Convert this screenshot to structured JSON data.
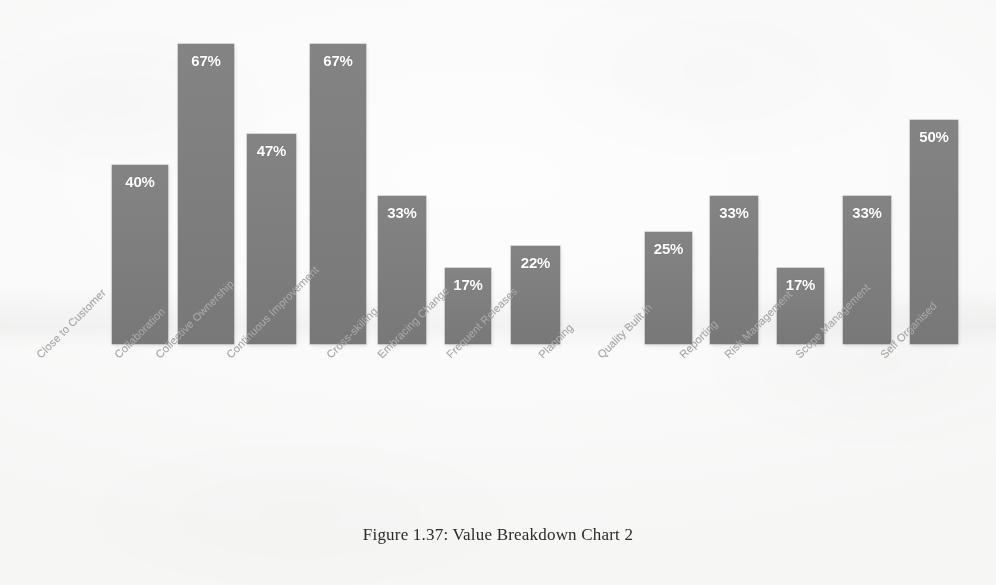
{
  "figure": {
    "caption": "Figure 1.37: Value Breakdown Chart 2"
  },
  "style": {
    "bar_color": "#7d7d7d",
    "value_label_color": "#ffffff",
    "category_label_color": "#a7a7a7",
    "background_color": "#fafafa",
    "caption_color": "#2b2b2b"
  },
  "chart_data": {
    "type": "bar",
    "title": "Figure 1.37: Value Breakdown Chart 2",
    "xlabel": "",
    "ylabel": "",
    "ylim": [
      0,
      70
    ],
    "grid": false,
    "legend": false,
    "orientation": "vertical",
    "value_label_position": "inside-top",
    "category_label_rotation": -45,
    "categories": [
      "Close to Customer",
      "Collaboration",
      "Collective Ownership",
      "Continuous Improvement",
      "Cross-skilling",
      "Embracing Change",
      "Frequent Releases",
      "Planning",
      "Quality Built in",
      "Reporting",
      "Risk Management",
      "Scope Management",
      "Self Organised"
    ],
    "values": [
      40,
      67,
      47,
      67,
      33,
      17,
      22,
      0,
      25,
      33,
      17,
      33,
      50
    ],
    "value_labels": [
      "40%",
      "67%",
      "47%",
      "67%",
      "33%",
      "17%",
      "22%",
      "",
      "25%",
      "33%",
      "17%",
      "33%",
      "50%"
    ],
    "bars": [
      {
        "category": "Close to Customer",
        "value": 40,
        "label": "40%",
        "x": 112,
        "width": 56
      },
      {
        "category": "Collaboration",
        "value": 67,
        "label": "67%",
        "x": 178,
        "width": 56
      },
      {
        "category": "Collective Ownership",
        "value": 47,
        "label": "47%",
        "x": 247,
        "width": 49
      },
      {
        "category": "Continuous Improvement",
        "value": 67,
        "label": "67%",
        "x": 310,
        "width": 56
      },
      {
        "category": "Cross-skilling",
        "value": 33,
        "label": "33%",
        "x": 378,
        "width": 48
      },
      {
        "category": "Embracing Change",
        "value": 17,
        "label": "17%",
        "x": 445,
        "width": 46
      },
      {
        "category": "Frequent Releases",
        "value": 22,
        "label": "22%",
        "x": 511,
        "width": 49
      },
      {
        "category": "Planning",
        "value": 0,
        "label": "",
        "x": 578,
        "width": 49
      },
      {
        "category": "Quality Built in",
        "value": 25,
        "label": "25%",
        "x": 645,
        "width": 47
      },
      {
        "category": "Reporting",
        "value": 33,
        "label": "33%",
        "x": 710,
        "width": 48
      },
      {
        "category": "Risk Management",
        "value": 17,
        "label": "17%",
        "x": 777,
        "width": 47
      },
      {
        "category": "Scope Management",
        "value": 33,
        "label": "33%",
        "x": 843,
        "width": 48
      },
      {
        "category": "Self Organised",
        "value": 50,
        "label": "50%",
        "x": 910,
        "width": 48
      }
    ],
    "axis_label_positions": [
      {
        "label": "Close to Customer",
        "x": 34
      },
      {
        "label": "Collaboration",
        "x": 112
      },
      {
        "label": "Collective Ownership",
        "x": 153
      },
      {
        "label": "Continuous Improvement",
        "x": 224
      },
      {
        "label": "Cross-skilling",
        "x": 324
      },
      {
        "label": "Embracing Change",
        "x": 375
      },
      {
        "label": "Frequent Releases",
        "x": 444
      },
      {
        "label": "Planning",
        "x": 536
      },
      {
        "label": "Quality Built in",
        "x": 595
      },
      {
        "label": "Reporting",
        "x": 677
      },
      {
        "label": "Risk Management",
        "x": 722
      },
      {
        "label": "Scope Management",
        "x": 793
      },
      {
        "label": "Self Organised",
        "x": 878
      }
    ],
    "scale": {
      "baseline_y": 344,
      "pixels_per_percent": 4.477
    }
  }
}
